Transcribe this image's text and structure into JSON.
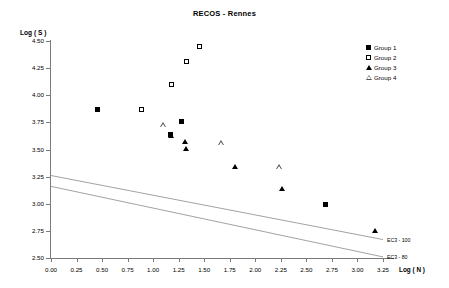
{
  "chart_data": {
    "type": "scatter",
    "title": "RECOS - Rennes",
    "xlabel": "Log ( N )",
    "ylabel": "Log ( S )",
    "xlim": [
      0.0,
      3.25
    ],
    "ylim": [
      2.5,
      4.5
    ],
    "xticks": [
      "0.00",
      "0.25",
      "0.50",
      "0.75",
      "1.00",
      "1.25",
      "1.50",
      "1.75",
      "2.00",
      "2.25",
      "2.50",
      "2.75",
      "3.00",
      "3.25"
    ],
    "xtick_values": [
      0.0,
      0.25,
      0.5,
      0.75,
      1.0,
      1.25,
      1.5,
      1.75,
      2.0,
      2.25,
      2.5,
      2.75,
      3.0,
      3.25
    ],
    "yticks": [
      "2.50",
      "2.75",
      "3.00",
      "3.25",
      "3.50",
      "3.75",
      "4.00",
      "4.25",
      "4.50"
    ],
    "ytick_values": [
      2.5,
      2.75,
      3.0,
      3.25,
      3.5,
      3.75,
      4.0,
      4.25,
      4.5
    ],
    "grid": false,
    "legend_position": "top-right",
    "series": [
      {
        "name": "Group 1",
        "marker": "filled-square",
        "color": "#000000",
        "points": [
          {
            "x": 0.46,
            "y": 3.87
          },
          {
            "x": 1.17,
            "y": 3.64
          },
          {
            "x": 1.28,
            "y": 3.76
          },
          {
            "x": 2.69,
            "y": 2.99
          }
        ]
      },
      {
        "name": "Group 2",
        "marker": "open-square",
        "color": "#000000",
        "points": [
          {
            "x": 0.89,
            "y": 3.87
          },
          {
            "x": 1.18,
            "y": 4.1
          },
          {
            "x": 1.33,
            "y": 4.31
          },
          {
            "x": 1.45,
            "y": 4.45
          }
        ]
      },
      {
        "name": "Group 3",
        "marker": "filled-triangle",
        "color": "#000000",
        "points": [
          {
            "x": 1.17,
            "y": 3.63
          },
          {
            "x": 1.31,
            "y": 3.57
          },
          {
            "x": 1.32,
            "y": 3.51
          },
          {
            "x": 1.8,
            "y": 3.34
          },
          {
            "x": 2.26,
            "y": 3.14
          },
          {
            "x": 3.17,
            "y": 2.75
          }
        ]
      },
      {
        "name": "Group 4",
        "marker": "open-triangle",
        "color": "#555555",
        "points": [
          {
            "x": 1.1,
            "y": 3.73
          },
          {
            "x": 1.66,
            "y": 3.56
          },
          {
            "x": 2.23,
            "y": 3.34
          }
        ]
      }
    ],
    "reference_lines": [
      {
        "name": "EC3 - 100",
        "label": "EC3 - 100",
        "x0": 0.0,
        "y0": 3.26,
        "x1": 3.25,
        "y1": 2.67
      },
      {
        "name": "EC3 - 80",
        "label": "EC3 - 80",
        "x0": 0.0,
        "y0": 3.16,
        "x1": 3.25,
        "y1": 2.51
      }
    ]
  },
  "legend": {
    "items": [
      {
        "label": "Group 1",
        "marker": "filled-square"
      },
      {
        "label": "Group 2",
        "marker": "open-square"
      },
      {
        "label": "Group 3",
        "marker": "filled-triangle"
      },
      {
        "label": "Group 4",
        "marker": "open-triangle"
      }
    ]
  }
}
